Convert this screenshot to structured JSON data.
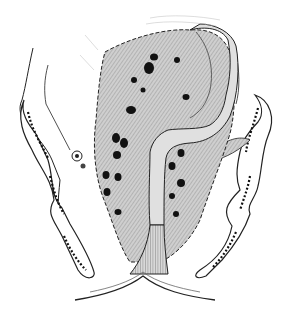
{
  "figure": {
    "type": "anatomical-illustration",
    "labels": [],
    "colors": {
      "background": "#ffffff",
      "line": "#1a1a1a",
      "shading": "#bdbdbd",
      "spots": "#111111"
    }
  }
}
